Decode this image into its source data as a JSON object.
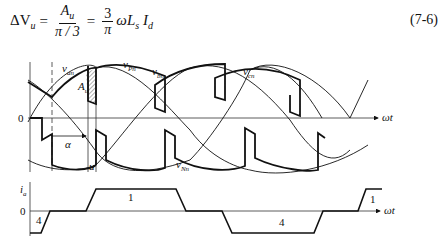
{
  "equation": {
    "lhs": "ΔV",
    "lhs_sub": "u",
    "frac1_num": "A",
    "frac1_num_sub": "u",
    "frac1_den": "π / 3",
    "frac2_num": "3",
    "frac2_den": "π",
    "rhs": "ωL",
    "rhs_sub1": "s",
    "rhs_i": "I",
    "rhs_sub2": "d",
    "number": "(7-6)"
  },
  "figure": {
    "top_panel": {
      "origin_label": "0",
      "axis_label": "ωt",
      "curve_labels": [
        {
          "text": "v",
          "sub": "an"
        },
        {
          "text": "v",
          "sub": "Pn"
        },
        {
          "text": "v",
          "sub": "bn"
        },
        {
          "text": "v",
          "sub": "cn"
        },
        {
          "text": "v",
          "sub": "Nn"
        }
      ],
      "area_label": {
        "text": "A",
        "sub": "u"
      },
      "alpha_label": "α",
      "u_label": "u"
    },
    "bottom_panel": {
      "y_label": {
        "text": "i",
        "sub": "a"
      },
      "origin_label": "0",
      "axis_label": "ωt",
      "segment_labels": [
        "4",
        "1",
        "4",
        "1"
      ]
    }
  }
}
